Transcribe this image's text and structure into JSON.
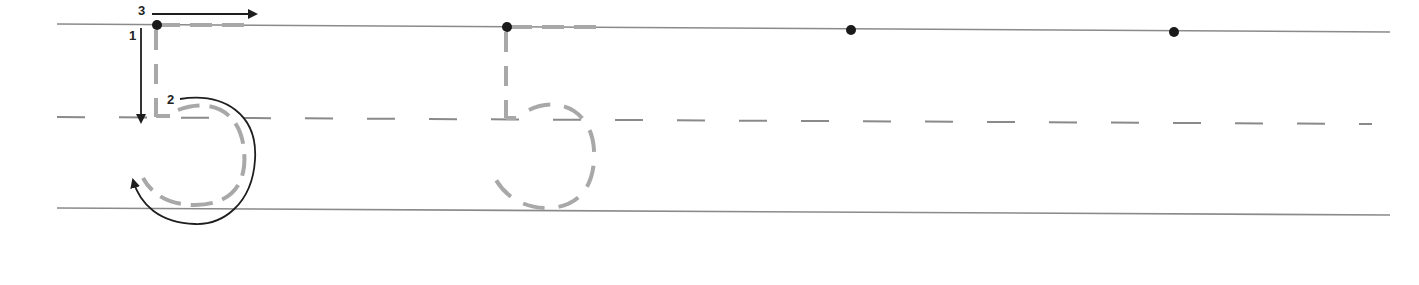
{
  "worksheet": {
    "title": "Number 5 tracing practice",
    "digit": "5",
    "colors": {
      "ruled_line": "#8a8a8a",
      "trace_dash": "#a8a8a8",
      "arrow": "#1e1e1e",
      "start_dot": "#1a1a1a",
      "background": "#ffffff"
    },
    "stroke_steps": [
      {
        "number": "1",
        "description": "Straight line down from the start dot"
      },
      {
        "number": "2",
        "description": "Curve around to the right and back"
      },
      {
        "number": "3",
        "description": "Line across the top to the right"
      }
    ],
    "practice_slots": [
      {
        "type": "model-with-arrows",
        "has_start_dot": true,
        "has_trace": true
      },
      {
        "type": "trace",
        "has_start_dot": true,
        "has_trace": true
      },
      {
        "type": "start-dot-only",
        "has_start_dot": true,
        "has_trace": false
      },
      {
        "type": "start-dot-only",
        "has_start_dot": true,
        "has_trace": false
      }
    ]
  }
}
